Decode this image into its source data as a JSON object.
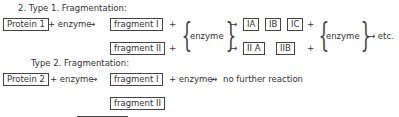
{
  "type1": {
    "heading": "2. Type 1. Fragmentation:",
    "protein": "Protein 1",
    "plus_enzyme": "+ enzyme",
    "arrow": "→",
    "fragment_1": "fragment  I",
    "fragment_2": "fragment  II",
    "plus": "+",
    "enzyme": "enzyme",
    "subfrags_1": [
      "IA",
      "IB",
      "IC"
    ],
    "subfrags_2": [
      "II A",
      "IIB"
    ],
    "enzyme2": "enzyme",
    "etc": "→ etc."
  },
  "type2": {
    "heading": "Type 2. Fragmentation:",
    "protein": "Protein 2",
    "plus_enzyme": "+ enzyme",
    "arrow": "→",
    "fragment_1": "fragment  I",
    "plus_enzyme2": "+ enzyme",
    "no_arrow": "↛",
    "result": "no further reaction",
    "fragment_2": "fragment  II"
  }
}
